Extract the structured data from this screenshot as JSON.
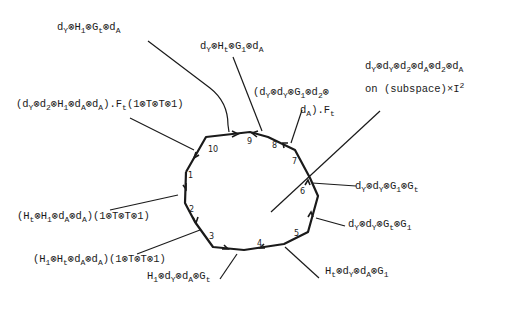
{
  "diagram": {
    "type": "decagon-boundary-cycle",
    "edge_numbers": [
      "1",
      "2",
      "3",
      "4",
      "5",
      "6",
      "7",
      "8",
      "9",
      "10"
    ],
    "labels": [
      {
        "id": "top-left",
        "html": "d<sub>Y</sub>⊗H<sub>1</sub>⊗G<sub>t</sub>⊗d<sub>A</sub>",
        "text": "dY⊗H1⊗Gt⊗dA"
      },
      {
        "id": "top-middle",
        "html": "d<sub>Y</sub>⊗H<sub>t</sub>⊗G<sub>1</sub>⊗d<sub>A</sub>",
        "text": "dY⊗Ht⊗G1⊗dA"
      },
      {
        "id": "edge-10",
        "html": "(d<sub>Y</sub>⊗d<sub>2</sub>⊗H<sub>1</sub>⊗d<sub>A</sub>⊗d<sub>A</sub>).F<sub>t</sub>(1⊗T⊗T⊗1)",
        "text": "(dY⊗d2⊗H1⊗dA⊗dA).Ft(1⊗T⊗T⊗1)"
      },
      {
        "id": "edge-7-line1",
        "html": "(d<sub>Y</sub>⊗d<sub>Y</sub>⊗G<sub>1</sub>⊗d<sub>2</sub>⊗",
        "text": "(dY⊗dY⊗G1⊗d2⊗"
      },
      {
        "id": "edge-7-line2",
        "html": "d<sub>A</sub>).F<sub>t</sub>",
        "text": "dA).Ft"
      },
      {
        "id": "interior-line1",
        "html": "d<sub>Y</sub>⊗d<sub>Y</sub>⊗d<sub>2</sub>⊗d<sub>A</sub>⊗d<sub>2</sub>⊗d<sub>A</sub>",
        "text": "dY⊗dY⊗d2⊗dA⊗d2⊗dA"
      },
      {
        "id": "interior-line2",
        "html": "on (subspace)×I<sup>2</sup>",
        "text": "on (subspace)×I²"
      },
      {
        "id": "edge-6",
        "html": "d<sub>Y</sub>⊗d<sub>Y</sub>⊗G<sub>1</sub>⊗G<sub>t</sub>",
        "text": "dY⊗dY⊗G1⊗Gt"
      },
      {
        "id": "edge-5",
        "html": "d<sub>Y</sub>⊗d<sub>Y</sub>⊗G<sub>t</sub>⊗G<sub>1</sub>",
        "text": "dY⊗dY⊗Gt⊗G1"
      },
      {
        "id": "edge-4-5",
        "html": "H<sub>t</sub>⊗d<sub>Y</sub>⊗d<sub>A</sub>⊗G<sub>1</sub>",
        "text": "Ht⊗dY⊗dA⊗G1"
      },
      {
        "id": "edge-2",
        "html": "(H<sub>t</sub>⊗H<sub>1</sub>⊗d<sub>A</sub>⊗d<sub>A</sub>)(1⊗T⊗T⊗1)",
        "text": "(Ht⊗H1⊗dA⊗dA)(1⊗T⊗T⊗1)"
      },
      {
        "id": "edge-3",
        "html": "(H<sub>1</sub>⊗H<sub>t</sub>⊗d<sub>A</sub>⊗d<sub>A</sub>)(1⊗T⊗T⊗1)",
        "text": "(H1⊗Ht⊗dA⊗dA)(1⊗T⊗T⊗1)"
      },
      {
        "id": "edge-3-4",
        "html": "H<sub>1</sub>⊗d<sub>Y</sub>⊗d<sub>A</sub>⊗G<sub>t</sub>",
        "text": "H1⊗dY⊗dA⊗Gt"
      }
    ]
  }
}
